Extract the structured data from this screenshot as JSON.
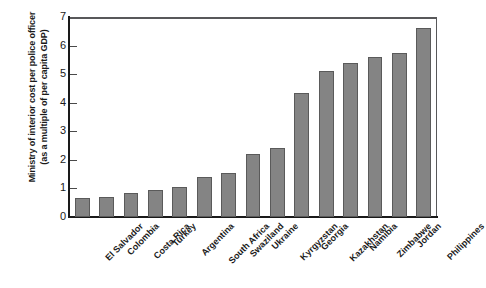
{
  "chart_data": {
    "type": "bar",
    "title": "",
    "subtitle": "",
    "xlabel": "",
    "ylabel": "Ministry of interior cost per police officer (as a multiple of per capita GDP)",
    "ylabel_line1": "Ministry of interior cost per police officer",
    "ylabel_line2": "(as a multiple of per capita GDP)",
    "categories": [
      "El Salvador",
      "Colombia",
      "Costa Rica",
      "Turkey",
      "Argentina",
      "South Africa",
      "Swaziland",
      "Ukraine",
      "Kyrgyzstan",
      "Georgia",
      "Kazakhstan",
      "Namibia",
      "Zimbabwe",
      "Jordan",
      "Philippines"
    ],
    "values": [
      0.65,
      0.7,
      0.85,
      0.95,
      1.05,
      1.4,
      1.55,
      2.2,
      2.4,
      4.35,
      5.1,
      5.4,
      5.6,
      5.75,
      6.6
    ],
    "ylim": [
      0,
      7
    ],
    "yticks": [
      0,
      1,
      2,
      3,
      4,
      5,
      6,
      7
    ],
    "ytick_labels": [
      "0",
      "1",
      "2",
      "3",
      "4",
      "5",
      "6",
      "7"
    ],
    "grid": false,
    "legend": false,
    "legend_position": "none",
    "bar_color": "#848484",
    "bar_border_color": "#5a5a5a",
    "axis_color": "#1a1a1a",
    "background": "#ffffff"
  }
}
